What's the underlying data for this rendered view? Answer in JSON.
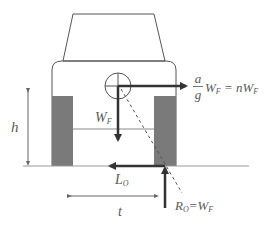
{
  "diagram": {
    "type": "free-body diagram of vehicle under lateral acceleration",
    "colors": {
      "outline": "#555555",
      "wheel_fill": "#7a7a7a",
      "force_arrow": "#333333",
      "ground": "#999999",
      "text": "#5a5a5a"
    },
    "labels": {
      "height": "h",
      "weight_main": "W",
      "weight_sub": "F",
      "inertia_frac_num": "a",
      "inertia_frac_den": "g",
      "inertia_rest_main": "W",
      "inertia_rest_sub": "F",
      "inertia_eq": " = nW",
      "inertia_eq_sub": "F",
      "lateral_main": "L",
      "lateral_sub": "O",
      "reaction_main": "R",
      "reaction_sub": "O",
      "reaction_eq": "=W",
      "reaction_eq_sub": "F",
      "track": "t"
    }
  }
}
